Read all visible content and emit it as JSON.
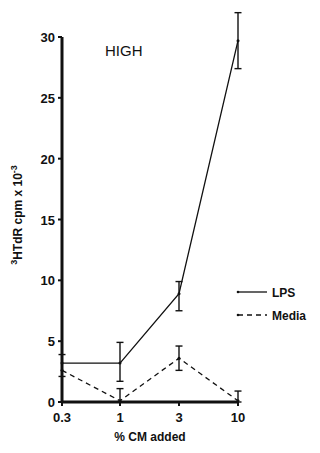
{
  "chart_data": {
    "type": "line",
    "title": "",
    "annotation": "HIGH",
    "xlabel": "% CM added",
    "ylabel_sup": "3",
    "ylabel_main": "HTdR cpm x 10",
    "ylabel_exp": "-3",
    "x_scale": "categorical-log",
    "categories": [
      "0.3",
      "1",
      "3",
      "10"
    ],
    "yticks": [
      0,
      5,
      10,
      15,
      20,
      25,
      30
    ],
    "ylim": [
      0,
      30
    ],
    "grid": false,
    "legend_position": "right",
    "series": [
      {
        "name": "LPS",
        "style": "solid",
        "values": [
          3.2,
          3.2,
          8.9,
          29.7
        ],
        "err_low": [
          3.2,
          1.7,
          7.5,
          27.4
        ],
        "err_high": [
          3.2,
          4.9,
          9.9,
          32.0
        ]
      },
      {
        "name": "Media",
        "style": "dashed",
        "values": [
          2.6,
          0.1,
          3.6,
          0.1
        ],
        "err_low": [
          2.1,
          0.0,
          2.6,
          0.0
        ],
        "err_high": [
          3.9,
          1.1,
          4.6,
          0.9
        ]
      }
    ],
    "colors": {
      "ink": "#111111",
      "background": "#ffffff"
    }
  }
}
